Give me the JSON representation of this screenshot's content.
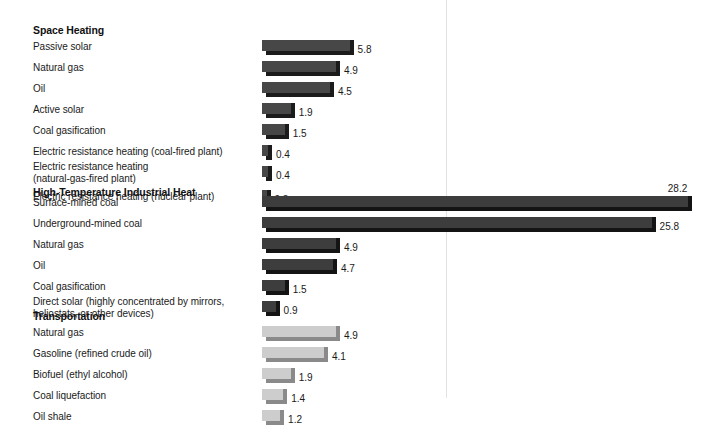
{
  "chart_data": {
    "type": "bar",
    "title": "",
    "orientation": "horizontal",
    "xlabel": "",
    "ylabel": "",
    "xlim": [
      0,
      29
    ],
    "grid": false,
    "legend": "none",
    "value_precision": 1,
    "groups": [
      {
        "name": "Space Heating",
        "bar_color": "#474747",
        "bar_shade_color": "#1b1b1b",
        "categories": [
          "Passive solar",
          "Natural gas",
          "Oil",
          "Active solar",
          "Coal gasification",
          "Electric resistance heating (coal-fired plant)",
          "Electric resistance heating\n(natural-gas-fired plant)",
          "Electric resistance heating (nuclear plant)"
        ],
        "values": [
          5.8,
          4.9,
          4.5,
          1.9,
          1.5,
          0.4,
          0.4,
          0.3
        ],
        "value_labels": [
          "5.8",
          "4.9",
          "4.5",
          "1.9",
          "1.5",
          "0.4",
          "0.4",
          "0.3"
        ]
      },
      {
        "name": "High-Temperature Industrial Heat",
        "bar_color": "#3d3d3d",
        "bar_shade_color": "#141414",
        "categories": [
          "Surface-mined coal",
          "Underground-mined coal",
          "Natural gas",
          "Oil",
          "Coal gasification",
          "Direct solar (highly concentrated by mirrors,\nheliostats, or other devices)"
        ],
        "values": [
          28.2,
          25.8,
          4.9,
          4.7,
          1.5,
          0.9
        ],
        "value_labels": [
          "28.2",
          "25.8",
          "4.9",
          "4.7",
          "1.5",
          "0.9"
        ]
      },
      {
        "name": "Transportation",
        "bar_color": "#cdcdcd",
        "bar_shade_color": "#8a8a8a",
        "categories": [
          "Natural gas",
          "Gasoline (refined crude oil)",
          "Biofuel (ethyl alcohol)",
          "Coal liquefaction",
          "Oil shale"
        ],
        "values": [
          4.9,
          4.1,
          1.9,
          1.4,
          1.2
        ],
        "value_labels": [
          "4.9",
          "4.1",
          "1.9",
          "1.4",
          "1.2"
        ]
      }
    ]
  },
  "layout": {
    "bar_origin_x": 262,
    "px_per_unit": 15.1,
    "divider_x": 446,
    "divider_color": "#e3e3e3",
    "section_tops": [
      24,
      186,
      310
    ],
    "row_pitch": 21,
    "section_row_offsets": [
      [
        16,
        37,
        58,
        79,
        100,
        121,
        142,
        166
      ],
      [
        10,
        31,
        52,
        73,
        94,
        115
      ],
      [
        16,
        37,
        58,
        79,
        100
      ]
    ],
    "label_offsets": [
      [
        1,
        1,
        1,
        1,
        1,
        1,
        -5,
        1
      ],
      [
        1,
        1,
        1,
        1,
        1,
        -5
      ],
      [
        1,
        1,
        1,
        1,
        1
      ]
    ],
    "value_above_indices": {
      "1": [
        0
      ]
    }
  }
}
